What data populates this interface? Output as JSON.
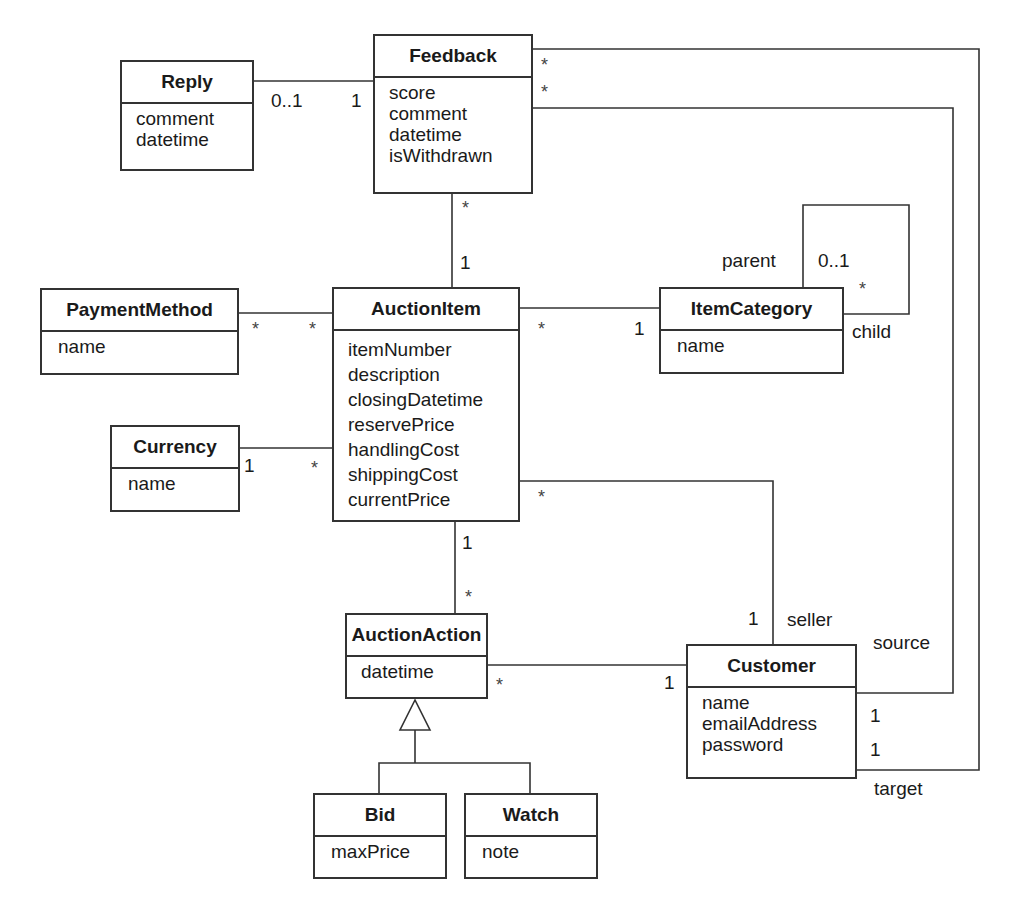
{
  "diagram": {
    "type": "UML class diagram",
    "classes": {
      "reply": {
        "name": "Reply",
        "attributes": [
          "comment",
          "datetime"
        ]
      },
      "feedback": {
        "name": "Feedback",
        "attributes": [
          "score",
          "comment",
          "datetime",
          "isWithdrawn"
        ]
      },
      "payment_method": {
        "name": "PaymentMethod",
        "attributes": [
          "name"
        ]
      },
      "auction_item": {
        "name": "AuctionItem",
        "attributes": [
          "itemNumber",
          "description",
          "closingDatetime",
          "reservePrice",
          "handlingCost",
          "shippingCost",
          "currentPrice"
        ]
      },
      "currency": {
        "name": "Currency",
        "attributes": [
          "name"
        ]
      },
      "item_category": {
        "name": "ItemCategory",
        "attributes": [
          "name"
        ]
      },
      "auction_action": {
        "name": "AuctionAction",
        "attributes": [
          "datetime"
        ]
      },
      "customer": {
        "name": "Customer",
        "attributes": [
          "name",
          "emailAddress",
          "password"
        ]
      },
      "bid": {
        "name": "Bid",
        "attributes": [
          "maxPrice"
        ]
      },
      "watch": {
        "name": "Watch",
        "attributes": [
          "note"
        ]
      }
    },
    "associations": [
      {
        "from": "Reply",
        "to": "Feedback",
        "from_mult": "0..1",
        "to_mult": "1"
      },
      {
        "from": "Feedback",
        "to": "AuctionItem",
        "from_mult": "*",
        "to_mult": "1"
      },
      {
        "from": "PaymentMethod",
        "to": "AuctionItem",
        "from_mult": "*",
        "to_mult": "*"
      },
      {
        "from": "Currency",
        "to": "AuctionItem",
        "from_mult": "1",
        "to_mult": "*"
      },
      {
        "from": "AuctionItem",
        "to": "ItemCategory",
        "from_mult": "*",
        "to_mult": "1"
      },
      {
        "from": "ItemCategory",
        "to": "ItemCategory",
        "parent_role": "parent",
        "parent_mult": "0..1",
        "child_role": "child",
        "child_mult": "*"
      },
      {
        "from": "AuctionItem",
        "to": "Customer",
        "from_mult": "*",
        "to_mult": "1",
        "to_role": "seller"
      },
      {
        "from": "AuctionItem",
        "to": "AuctionAction",
        "from_mult": "1",
        "to_mult": "*"
      },
      {
        "from": "AuctionAction",
        "to": "Customer",
        "from_mult": "*",
        "to_mult": "1"
      },
      {
        "from": "Feedback",
        "to": "Customer",
        "from_mult": "*",
        "to_mult": "1",
        "to_role": "source"
      },
      {
        "from": "Feedback",
        "to": "Customer",
        "from_mult": "*",
        "to_mult": "1",
        "to_role": "target"
      }
    ],
    "generalization": {
      "parent": "AuctionAction",
      "children": [
        "Bid",
        "Watch"
      ]
    },
    "labels": {
      "reply_feedback_reply_end": "0..1",
      "reply_feedback_feedback_end": "1",
      "feedback_target_star": "*",
      "feedback_source_star": "*",
      "feedback_item_feedback_end": "*",
      "feedback_item_item_end": "1",
      "payment_item_payment_end": "*",
      "payment_item_item_end": "*",
      "currency_item_currency_end": "1",
      "currency_item_item_end": "*",
      "item_category_item_end": "*",
      "item_category_category_end": "1",
      "self_parent_role": "parent",
      "self_parent_mult": "0..1",
      "self_child_mult": "*",
      "self_child_role": "child",
      "item_seller_item_end": "*",
      "item_seller_customer_end": "1",
      "seller_role": "seller",
      "item_action_item_end": "1",
      "item_action_action_end": "*",
      "action_customer_action_end": "*",
      "action_customer_customer_end": "1",
      "source_role": "source",
      "source_mult": "1",
      "target_mult": "1",
      "target_role": "target"
    }
  },
  "colors": {
    "line": "#333333",
    "text": "#1a1a1a",
    "background": "#ffffff"
  }
}
